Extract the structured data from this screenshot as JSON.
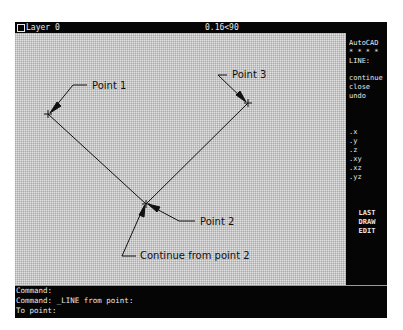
{
  "status_bar": {
    "layer_label": "Layer 0",
    "coordinates": "0.16<90"
  },
  "side_menu": {
    "title": "AutoCAD",
    "separator": "* * * *",
    "command": "LINE:",
    "items": [
      {
        "label": "continue"
      },
      {
        "label": "close"
      },
      {
        "label": "undo"
      }
    ],
    "filters": [
      {
        "label": ".x"
      },
      {
        "label": ".y"
      },
      {
        "label": ".z"
      },
      {
        "label": ".xy"
      },
      {
        "label": ".xz"
      },
      {
        "label": ".yz"
      }
    ],
    "bottom": [
      {
        "label": "LAST"
      },
      {
        "label": "DRAW"
      },
      {
        "label": "EDIT"
      }
    ]
  },
  "drawing": {
    "annotations": {
      "point1": "Point 1",
      "point2": "Point 2",
      "point3": "Point 3",
      "continue": "Continue from point 2"
    },
    "line_color": "#111111",
    "background_color": "#e2e2e2"
  },
  "command_area": {
    "lines": [
      "Command:",
      "Command: _LINE from point:",
      "To point:"
    ]
  }
}
